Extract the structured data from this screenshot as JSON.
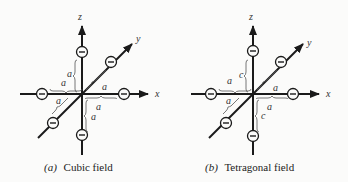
{
  "figures": [
    {
      "id": "a",
      "caption_letter": "(a)",
      "caption_text": "Cubic field",
      "axes": {
        "x": "x",
        "y": "y",
        "z": "z"
      },
      "charge_symbol": "−",
      "distances": {
        "z_up": "a",
        "x_left": "a",
        "y_far": "a",
        "y_near": "a",
        "x_right": "a",
        "z_down": "a"
      }
    },
    {
      "id": "b",
      "caption_letter": "(b)",
      "caption_text": "Tetragonal field",
      "axes": {
        "x": "x",
        "y": "y",
        "z": "z"
      },
      "charge_symbol": "−",
      "distances": {
        "z_up": "c",
        "x_left": "a",
        "y_far": "a",
        "y_near": "a",
        "x_right": "a",
        "z_down": "c"
      }
    }
  ]
}
